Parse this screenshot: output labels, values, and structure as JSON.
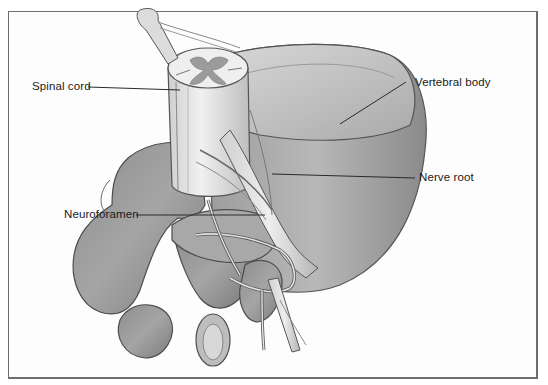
{
  "figure": {
    "labels": {
      "spinal_cord": "Spinal cord",
      "vertebral_body": "Vertebral body",
      "nerve_root": "Nerve root",
      "neuroforamen": "Neuroforamen"
    }
  },
  "colors": {
    "frame_border": "#6d6d6d",
    "label_text": "#1a1a1a",
    "bone_shade": "#9a9a9a",
    "cord_light": "#ececec"
  }
}
